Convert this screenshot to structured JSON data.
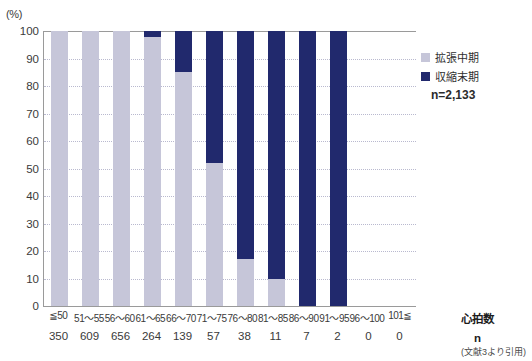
{
  "chart_data": {
    "type": "bar",
    "subtype": "stacked-100-percent",
    "title": "",
    "xlabel": "心拍数",
    "ylabel": "(%)",
    "ylim": [
      0,
      100
    ],
    "yticks": [
      100,
      90,
      80,
      70,
      60,
      50,
      40,
      30,
      20,
      10,
      0
    ],
    "grid": true,
    "categories": [
      "≦50",
      "51〜55",
      "56〜60",
      "61〜65",
      "66〜70",
      "71〜75",
      "76〜80",
      "81〜85",
      "86〜90",
      "91〜95",
      "96〜100",
      "101≦"
    ],
    "sample_counts": [
      "350",
      "609",
      "656",
      "264",
      "139",
      "57",
      "38",
      "11",
      "7",
      "2",
      "0",
      "0"
    ],
    "sample_count_label": "n",
    "n_total": "n=2,133",
    "series": [
      {
        "name": "拡張中期",
        "color": "#c6c6d9",
        "values": [
          100,
          100,
          100,
          98,
          85,
          52,
          17,
          10,
          0,
          0,
          0,
          0
        ]
      },
      {
        "name": "収縮末期",
        "color": "#21296d",
        "values": [
          0,
          0,
          0,
          2,
          15,
          48,
          83,
          90,
          100,
          100,
          0,
          0
        ]
      }
    ],
    "legend_position": "right-top",
    "source_note": "(文献3より引用)"
  },
  "legend": {
    "entries": [
      {
        "label": "拡張中期",
        "color": "#c6c6d9"
      },
      {
        "label": "収縮末期",
        "color": "#21296d"
      }
    ]
  },
  "axis": {
    "y_unit": "(%)",
    "x_title": "心拍数",
    "n_row_title": "n"
  }
}
